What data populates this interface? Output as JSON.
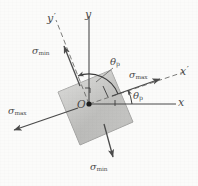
{
  "figure": {
    "background_color": "#fbfbfa",
    "ink_color": "#4b4b4b",
    "element_fill_light": "#e2e2e0",
    "element_fill_dark": "#9e9e9c"
  },
  "axes": {
    "x": {
      "label": "x",
      "kind": "solid-axis",
      "direction": "right"
    },
    "y": {
      "label": "y",
      "kind": "solid-axis",
      "direction": "up"
    },
    "x_prime": {
      "label": "x",
      "prime": "′",
      "kind": "dashed-axis",
      "direction": "up-right"
    },
    "y_prime": {
      "label": "y",
      "prime": "′",
      "kind": "dashed-axis",
      "direction": "up-left"
    }
  },
  "origin": {
    "label": "O"
  },
  "angles": [
    {
      "name": "theta-p-upper",
      "symbol": "θ",
      "subscript": "p"
    },
    {
      "name": "theta-p-lower",
      "symbol": "θ",
      "subscript": "p"
    }
  ],
  "stresses": [
    {
      "name": "sigma-max-right",
      "symbol": "σ",
      "subscript": "max",
      "direction": "up-right"
    },
    {
      "name": "sigma-max-left",
      "symbol": "σ",
      "subscript": "max",
      "direction": "down-left"
    },
    {
      "name": "sigma-min-upper",
      "symbol": "σ",
      "subscript": "min",
      "direction": "up-left"
    },
    {
      "name": "sigma-min-lower",
      "symbol": "σ",
      "subscript": "min",
      "direction": "down-right"
    }
  ],
  "element": {
    "name": "stress-element-square",
    "shape": "rotated-square",
    "rotation_deg": -22
  }
}
